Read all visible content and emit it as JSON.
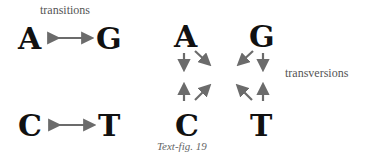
{
  "figure": {
    "left_panel": {
      "label": "transitions",
      "top_pair": [
        "A",
        "G"
      ],
      "bottom_pair": [
        "C",
        "T"
      ]
    },
    "right_panel": {
      "label": "transversions",
      "top_row": [
        "A",
        "G"
      ],
      "bottom_row": [
        "C",
        "T"
      ]
    },
    "caption": "Text-fig. 19",
    "colors": {
      "letters": "#111111",
      "arrows": "#6b6b6b",
      "text": "#555555"
    }
  }
}
